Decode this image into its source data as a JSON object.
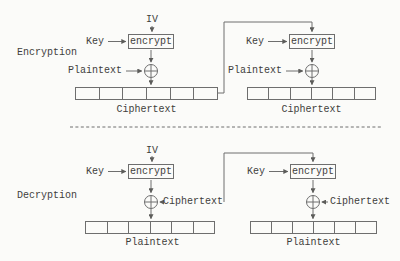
{
  "colors": {
    "background": "#fbfbf9",
    "stroke": "#6e6e6e",
    "text": "#3f3e3c"
  },
  "registers": {
    "cells_per_block": 6
  },
  "encryption": {
    "section_label": "Encryption",
    "iv_label": "IV",
    "key_label": "Key",
    "encrypt_box_label": "encrypt",
    "input_label": "Plaintext",
    "register_caption": "Ciphertext"
  },
  "decryption": {
    "section_label": "Decryption",
    "iv_label": "IV",
    "key_label": "Key",
    "encrypt_box_label": "encrypt",
    "xor_input_label": "Ciphertext",
    "register_caption": "Plaintext"
  }
}
